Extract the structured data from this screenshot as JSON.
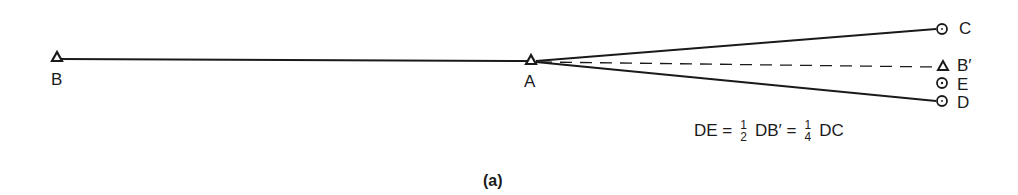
{
  "diagram": {
    "points": {
      "B": {
        "label": "B",
        "marker": "triangle-station"
      },
      "A": {
        "label": "A",
        "marker": "triangle-station"
      },
      "C": {
        "label": "C",
        "marker": "circle-target"
      },
      "B_prime": {
        "label": "B′",
        "marker": "triangle-station"
      },
      "E": {
        "label": "E",
        "marker": "circle-dot-point"
      },
      "D": {
        "label": "D",
        "marker": "circle-target"
      }
    },
    "lines": [
      {
        "from": "B",
        "to": "A",
        "style": "solid"
      },
      {
        "from": "A",
        "to": "C",
        "style": "solid"
      },
      {
        "from": "A",
        "to": "D",
        "style": "solid"
      },
      {
        "from": "A",
        "to": "B′",
        "style": "dashed"
      }
    ],
    "equation": {
      "lhs": "DE =",
      "frac1_num": "1",
      "frac1_den": "2",
      "mid": "DB′ =",
      "frac2_num": "1",
      "frac2_den": "4",
      "rhs": "DC"
    },
    "caption": "(a)"
  }
}
